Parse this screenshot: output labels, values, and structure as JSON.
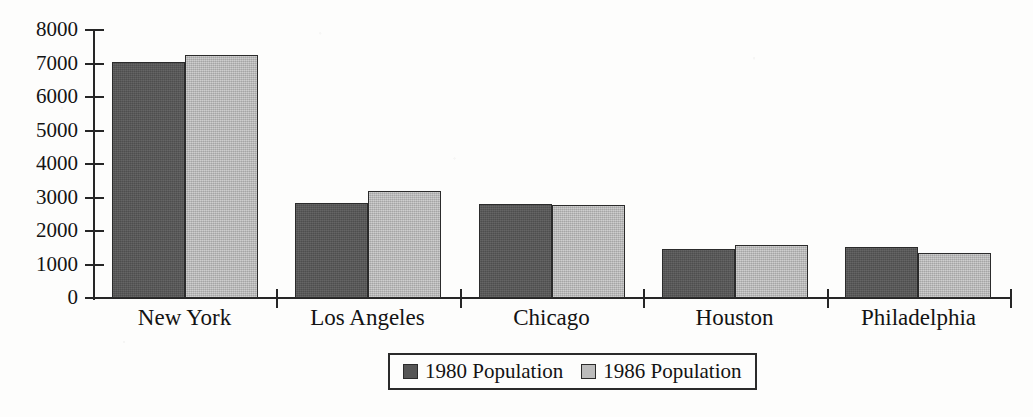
{
  "chart_data": {
    "type": "bar",
    "title": "",
    "subtitle": "",
    "xlabel": "",
    "ylabel": "",
    "categories": [
      "New York",
      "Los Angeles",
      "Chicago",
      "Houston",
      "Philadelphia"
    ],
    "series": [
      {
        "name": "1980 Population",
        "color": "#565656",
        "values": [
          7050,
          2850,
          2820,
          1450,
          1510
        ]
      },
      {
        "name": "1986 Population",
        "color": "#bcbcbc",
        "values": [
          7250,
          3180,
          2790,
          1580,
          1350
        ]
      }
    ],
    "ylim": [
      0,
      8000
    ],
    "ytick_labels": [
      "8000",
      "7000",
      "6000",
      "5000",
      "4000",
      "3000",
      "2000",
      "1000",
      "0"
    ],
    "ytick_values": [
      8000,
      7000,
      6000,
      5000,
      4000,
      3000,
      2000,
      1000,
      0
    ],
    "grid": false,
    "legend_position": "bottom-center",
    "legend_entries": [
      "1980 Population",
      "1986 Population"
    ],
    "axis_color": "#262626",
    "background_color": "#fdfdfc"
  }
}
